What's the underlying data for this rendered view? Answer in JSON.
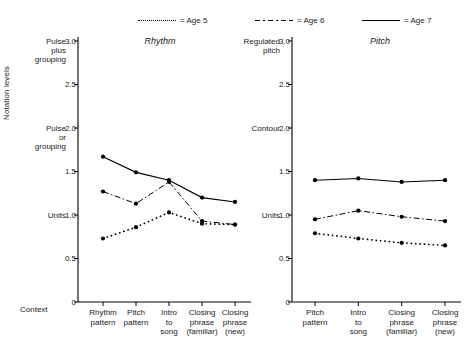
{
  "legend": {
    "items": [
      {
        "label": "= Age 5",
        "style": "dotted",
        "name": "legend-age-5"
      },
      {
        "label": "= Age 6",
        "style": "dashdot",
        "name": "legend-age-6"
      },
      {
        "label": "= Age 7",
        "style": "solid",
        "name": "legend-age-7"
      }
    ]
  },
  "axis": {
    "ylabel": "Notation levels",
    "xlabel": "Context",
    "yticks": [
      "3.0",
      "2.5",
      "2.0",
      "1.5",
      "1.0",
      "0.5",
      "0"
    ],
    "left_named": {
      "top": "Pulse\nplus\ngrouping",
      "mid": "Pulse\nor\ngrouping",
      "low": "Units"
    },
    "left_named_top_l1": "Pulse",
    "left_named_top_l2": "plus",
    "left_named_top_l3": "grouping",
    "left_named_mid_l1": "Pulse",
    "left_named_mid_l2": "or",
    "left_named_mid_l3": "grouping",
    "left_named_low": "Units",
    "right_named_top_l1": "Regulated",
    "right_named_top_l2": "pitch",
    "right_named_mid": "Contour",
    "right_named_low": "Units"
  },
  "panels": [
    {
      "title": "Rhythm",
      "name": "panel-rhythm"
    },
    {
      "title": "Pitch",
      "name": "panel-pitch"
    }
  ],
  "chart_data": [
    {
      "type": "line",
      "title": "Rhythm",
      "xlabel": "Context",
      "ylabel": "Notation levels",
      "ylim": [
        0,
        3.0
      ],
      "yticks": [
        0,
        0.5,
        1.0,
        1.5,
        2.0,
        2.5,
        3.0
      ],
      "ytick_names": {
        "1.0": "Units",
        "2.0": "Pulse or grouping",
        "3.0": "Pulse plus grouping"
      },
      "grid": false,
      "legend_position": "top",
      "categories": [
        "Rhythm pattern",
        "Pitch pattern",
        "Intro to song",
        "Closing phrase (familiar)",
        "Closing phrase (new)"
      ],
      "categories_lines": [
        [
          "Rhythm",
          "pattern"
        ],
        [
          "Pitch",
          "pattern"
        ],
        [
          "Intro",
          "to",
          "song"
        ],
        [
          "Closing",
          "phrase",
          "(familiar)"
        ],
        [
          "Closing",
          "phrase",
          "(new)"
        ]
      ],
      "series": [
        {
          "name": "Age 5",
          "style": "dotted",
          "values": [
            0.73,
            0.86,
            1.03,
            0.9,
            0.89
          ]
        },
        {
          "name": "Age 6",
          "style": "dashdot",
          "values": [
            1.27,
            1.13,
            1.38,
            0.93,
            0.89
          ]
        },
        {
          "name": "Age 7",
          "style": "solid",
          "values": [
            1.67,
            1.49,
            1.4,
            1.2,
            1.15
          ]
        }
      ]
    },
    {
      "type": "line",
      "title": "Pitch",
      "xlabel": "Context",
      "ylabel": "Notation levels",
      "ylim": [
        0,
        3.0
      ],
      "yticks": [
        0,
        0.5,
        1.0,
        1.5,
        2.0,
        2.5,
        3.0
      ],
      "ytick_names": {
        "1.0": "Units",
        "2.0": "Contour",
        "3.0": "Regulated pitch"
      },
      "grid": false,
      "legend_position": "top",
      "categories": [
        "Pitch pattern",
        "Intro to song",
        "Closing phrase (familiar)",
        "Closing phrase (new)"
      ],
      "categories_lines": [
        [
          "Pitch",
          "pattern"
        ],
        [
          "Intro",
          "to",
          "song"
        ],
        [
          "Closing",
          "phrase",
          "(familiar)"
        ],
        [
          "Closing",
          "phrase",
          "(new)"
        ]
      ],
      "series": [
        {
          "name": "Age 5",
          "style": "dotted",
          "values": [
            0.79,
            0.73,
            0.68,
            0.65
          ]
        },
        {
          "name": "Age 6",
          "style": "dashdot",
          "values": [
            0.95,
            1.05,
            0.98,
            0.93
          ]
        },
        {
          "name": "Age 7",
          "style": "solid",
          "values": [
            1.4,
            1.42,
            1.38,
            1.4
          ]
        }
      ]
    }
  ]
}
